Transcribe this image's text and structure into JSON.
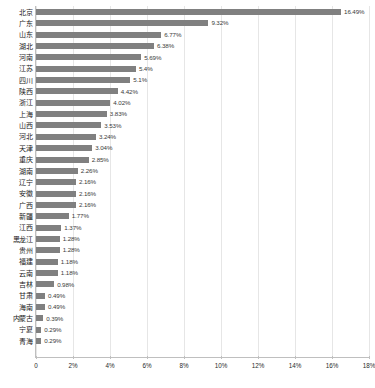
{
  "chart_data": {
    "type": "bar",
    "orientation": "horizontal",
    "title": "",
    "xlabel": "",
    "ylabel": "",
    "xlim": [
      0,
      18
    ],
    "grid": true,
    "legend": "none",
    "bar_color": "#808080",
    "value_suffix": "%",
    "xticks": [
      "0",
      "2%",
      "4%",
      "6%",
      "8%",
      "10%",
      "12%",
      "14%",
      "16%",
      "18%"
    ],
    "xtick_values": [
      0,
      2,
      4,
      6,
      8,
      10,
      12,
      14,
      16,
      18
    ],
    "categories": [
      "北京",
      "广东",
      "山东",
      "湖北",
      "河南",
      "江苏",
      "四川",
      "陕西",
      "浙江",
      "上海",
      "山西",
      "河北",
      "天津",
      "重庆",
      "湖南",
      "辽宁",
      "安徽",
      "广西",
      "新疆",
      "江西",
      "黑龙江",
      "贵州",
      "福建",
      "云南",
      "吉林",
      "甘肃",
      "海南",
      "内蒙古",
      "宁夏",
      "青海"
    ],
    "values": [
      16.49,
      9.32,
      6.77,
      6.38,
      5.69,
      5.4,
      5.1,
      4.42,
      4.02,
      3.83,
      3.53,
      3.24,
      3.04,
      2.85,
      2.26,
      2.16,
      2.16,
      2.16,
      1.77,
      1.37,
      1.28,
      1.28,
      1.18,
      1.18,
      0.98,
      0.49,
      0.49,
      0.39,
      0.29,
      0.29
    ],
    "value_labels": [
      "16.49%",
      "9.32%",
      "6.77%",
      "6.38%",
      "5.69%",
      "5.4%",
      "5.1%",
      "4.42%",
      "4.02%",
      "3.83%",
      "3.53%",
      "3.24%",
      "3.04%",
      "2.85%",
      "2.26%",
      "2.16%",
      "2.16%",
      "2.16%",
      "1.77%",
      "1.37%",
      "1.28%",
      "1.28%",
      "1.18%",
      "1.18%",
      "0.98%",
      "0.49%",
      "0.49%",
      "0.39%",
      "0.29%",
      "0.29%"
    ]
  }
}
